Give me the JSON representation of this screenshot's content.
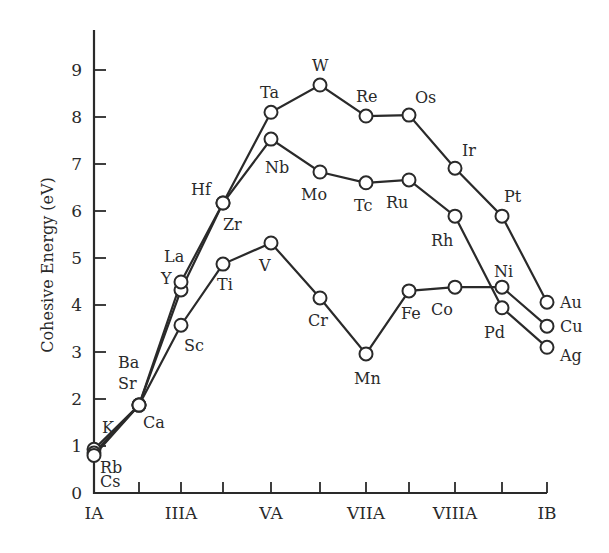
{
  "chart_data": {
    "type": "line",
    "title": "",
    "xlabel": "",
    "ylabel": "Cohesive Energy (eV)",
    "ylim": [
      0,
      9.8
    ],
    "grid": false,
    "legend": null,
    "categories": [
      "IA",
      "IIA",
      "IIIA",
      "IVA",
      "VA",
      "VIA",
      "VIIA",
      "VIII",
      "VIIIA",
      "VIII",
      "IB"
    ],
    "x_tick_labels": [
      {
        "index": 0,
        "label": "IA"
      },
      {
        "index": 2,
        "label": "IIIA"
      },
      {
        "index": 4,
        "label": "VA"
      },
      {
        "index": 6,
        "label": "VIIA"
      },
      {
        "index": 8,
        "label": "VIIIA"
      },
      {
        "index": 10,
        "label": "IB"
      }
    ],
    "y_ticks": [
      0,
      1,
      2,
      3,
      4,
      5,
      6,
      7,
      8,
      9
    ],
    "series": [
      {
        "name": "Period 4 (3d)",
        "elements": [
          "K",
          "Ca",
          "Sc",
          "Ti",
          "V",
          "Cr",
          "Mn",
          "Fe",
          "Co",
          "Ni",
          "Cu"
        ],
        "values": [
          0.93,
          1.87,
          3.57,
          4.87,
          5.32,
          4.15,
          2.96,
          4.3,
          4.38,
          4.38,
          3.55
        ]
      },
      {
        "name": "Period 5 (4d)",
        "elements": [
          "Rb",
          "Sr",
          "Y",
          "Zr",
          "Nb",
          "Mo",
          "Tc",
          "Ru",
          "Rh",
          "Pd",
          "Ag"
        ],
        "values": [
          0.85,
          1.87,
          4.32,
          6.17,
          7.53,
          6.83,
          6.6,
          6.66,
          5.89,
          3.94,
          3.1
        ]
      },
      {
        "name": "Period 6 (5d)",
        "elements": [
          "Cs",
          "Ba",
          "La",
          "Hf",
          "Ta",
          "W",
          "Re",
          "Os",
          "Ir",
          "Pt",
          "Au"
        ],
        "values": [
          0.8,
          1.87,
          4.49,
          6.17,
          8.1,
          8.68,
          8.02,
          8.04,
          6.91,
          5.89,
          4.06
        ]
      }
    ],
    "point_labels": [
      {
        "text": "K",
        "series": 0,
        "index": 0,
        "dx": 8,
        "dy": -16
      },
      {
        "text": "Ca",
        "series": 0,
        "index": 1,
        "dx": 4,
        "dy": 23
      },
      {
        "text": "Sc",
        "series": 0,
        "index": 2,
        "dx": 3,
        "dy": 26
      },
      {
        "text": "Ti",
        "series": 0,
        "index": 3,
        "dx": -6,
        "dy": 26
      },
      {
        "text": "V",
        "series": 0,
        "index": 4,
        "dx": -12,
        "dy": 28
      },
      {
        "text": "Cr",
        "series": 0,
        "index": 5,
        "dx": -12,
        "dy": 28
      },
      {
        "text": "Mn",
        "series": 0,
        "index": 6,
        "dx": -12,
        "dy": 30
      },
      {
        "text": "Fe",
        "series": 0,
        "index": 7,
        "dx": -8,
        "dy": 28
      },
      {
        "text": "Co",
        "series": 0,
        "index": 8,
        "dx": -24,
        "dy": 28
      },
      {
        "text": "Ni",
        "series": 0,
        "index": 9,
        "dx": -8,
        "dy": -10
      },
      {
        "text": "Cu",
        "series": 0,
        "index": 10,
        "dx": 13,
        "dy": 6
      },
      {
        "text": "Rb",
        "series": 1,
        "index": 0,
        "dx": 6,
        "dy": 20
      },
      {
        "text": "Sr",
        "series": 1,
        "index": 1,
        "dx": -21,
        "dy": -16
      },
      {
        "text": "Y",
        "series": 1,
        "index": 2,
        "dx": -20,
        "dy": -6
      },
      {
        "text": "Zr",
        "series": 1,
        "index": 3,
        "dx": 0,
        "dy": 27
      },
      {
        "text": "Nb",
        "series": 1,
        "index": 4,
        "dx": -6,
        "dy": 34
      },
      {
        "text": "Mo",
        "series": 1,
        "index": 5,
        "dx": -19,
        "dy": 28
      },
      {
        "text": "Tc",
        "series": 1,
        "index": 6,
        "dx": -12,
        "dy": 28
      },
      {
        "text": "Ru",
        "series": 1,
        "index": 7,
        "dx": -23,
        "dy": 28
      },
      {
        "text": "Rh",
        "series": 1,
        "index": 8,
        "dx": -24,
        "dy": 30
      },
      {
        "text": "Pd",
        "series": 1,
        "index": 9,
        "dx": -18,
        "dy": 30
      },
      {
        "text": "Ag",
        "series": 1,
        "index": 10,
        "dx": 13,
        "dy": 14
      },
      {
        "text": "Cs",
        "series": 2,
        "index": 0,
        "dx": 6,
        "dy": 32
      },
      {
        "text": "Ba",
        "series": 2,
        "index": 1,
        "dx": -21,
        "dy": -37
      },
      {
        "text": "La",
        "series": 2,
        "index": 2,
        "dx": -17,
        "dy": -20
      },
      {
        "text": "Hf",
        "series": 2,
        "index": 3,
        "dx": -32,
        "dy": -8
      },
      {
        "text": "Ta",
        "series": 2,
        "index": 4,
        "dx": -11,
        "dy": -14
      },
      {
        "text": "W",
        "series": 2,
        "index": 5,
        "dx": -8,
        "dy": -14
      },
      {
        "text": "Re",
        "series": 2,
        "index": 6,
        "dx": -10,
        "dy": -14
      },
      {
        "text": "Os",
        "series": 2,
        "index": 7,
        "dx": 6,
        "dy": -12
      },
      {
        "text": "Ir",
        "series": 2,
        "index": 8,
        "dx": 7,
        "dy": -12
      },
      {
        "text": "Pt",
        "series": 2,
        "index": 9,
        "dx": 2,
        "dy": -14
      },
      {
        "text": "Au",
        "series": 2,
        "index": 10,
        "dx": 13,
        "dy": 6
      }
    ]
  },
  "layout": {
    "x_positions": [
      94,
      139,
      181,
      223,
      271,
      320,
      366,
      409,
      455,
      502,
      547
    ],
    "y_zero": 493,
    "px_per_unit": 47,
    "y_axis_top": 30,
    "x_axis_right": 547
  }
}
